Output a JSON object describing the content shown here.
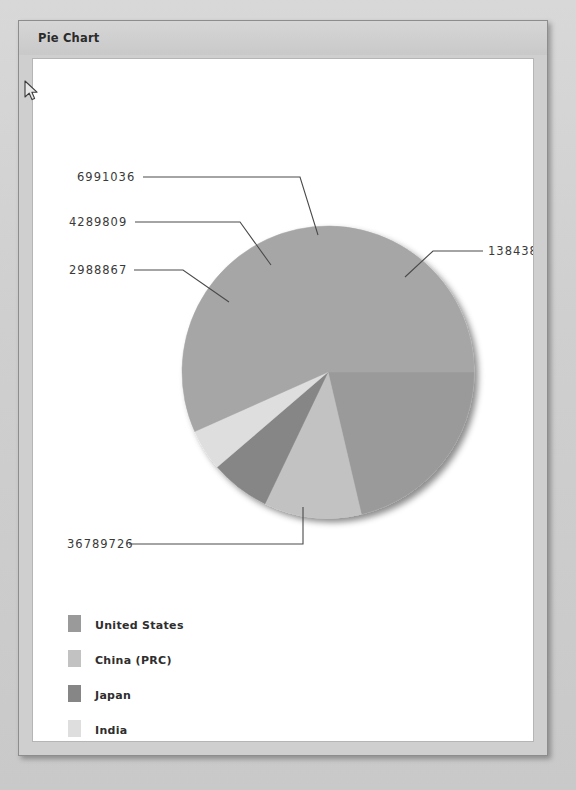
{
  "window": {
    "title": "Pie Chart"
  },
  "cursor": {
    "icon": "mouse-pointer-icon",
    "x": 27,
    "y": 84
  },
  "chart_data": {
    "type": "pie",
    "title": "Pie Chart",
    "categories": [
      "United States",
      "China (PRC)",
      "Japan",
      "India",
      "Rest of the World"
    ],
    "values": [
      13843825,
      6991036,
      4289809,
      2988867,
      36789726
    ],
    "value_labels": [
      "13843825",
      "6991036",
      "4289809",
      "2988867",
      "36789726"
    ],
    "colors": [
      "#9a9a9a",
      "#c2c2c2",
      "#868686",
      "#dedede",
      "#a6a6a6"
    ],
    "total": 64903263,
    "legend_position": "bottom-left",
    "labels_shown": "values",
    "grid": false,
    "xlabel": "",
    "ylabel": ""
  },
  "legend": {
    "items": [
      {
        "label": "United States",
        "color": "#9a9a9a"
      },
      {
        "label": "China (PRC)",
        "color": "#c2c2c2"
      },
      {
        "label": "Japan",
        "color": "#868686"
      },
      {
        "label": "India",
        "color": "#dedede"
      },
      {
        "label": "Rest of the World",
        "color": "#a6a6a6"
      }
    ]
  },
  "callouts": [
    {
      "value": "6991036",
      "text_x": 44,
      "text_y": 121
    },
    {
      "value": "4289809",
      "text_x": 36,
      "text_y": 166
    },
    {
      "value": "2988867",
      "text_x": 36,
      "text_y": 214
    },
    {
      "value": "13843825",
      "text_x": 454,
      "text_y": 195
    },
    {
      "value": "36789726",
      "text_x": 34,
      "text_y": 488
    }
  ]
}
